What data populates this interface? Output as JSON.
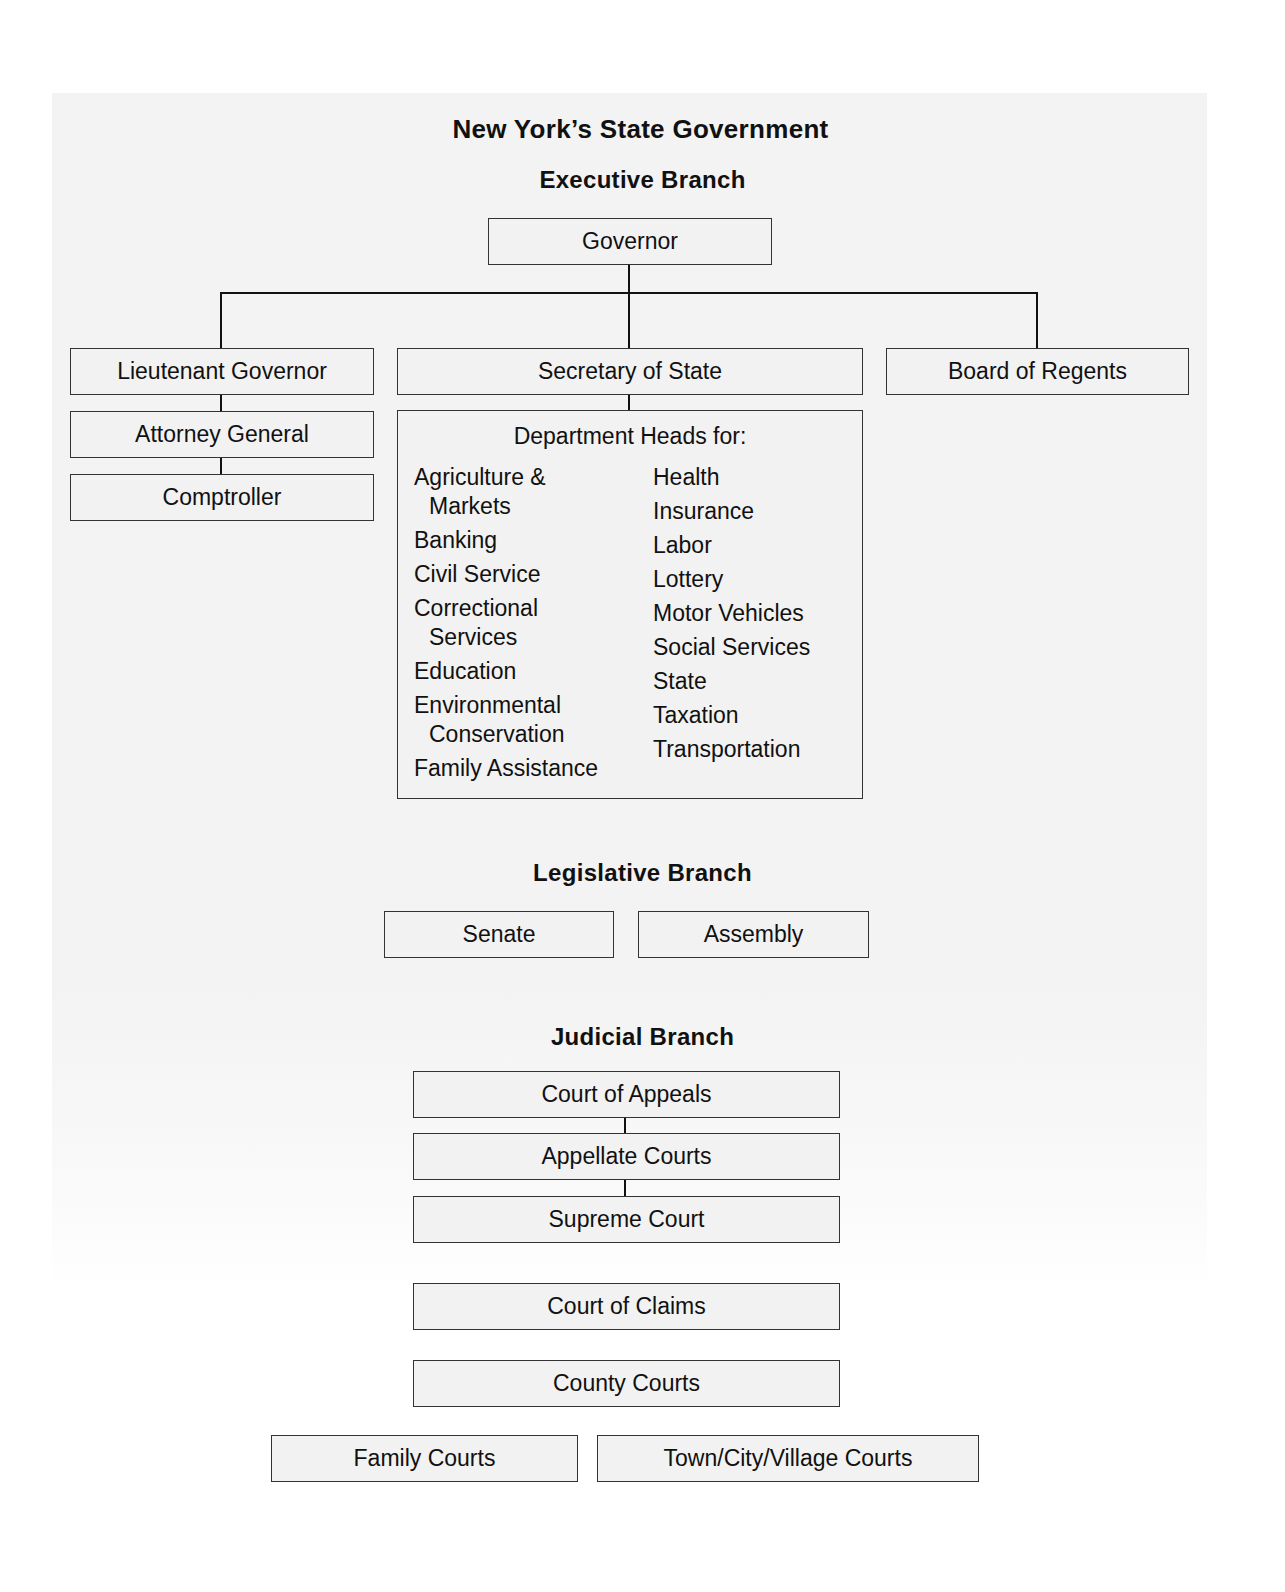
{
  "title": "New York’s State Government",
  "executive": {
    "heading": "Executive Branch",
    "governor": "Governor",
    "lieutenant_governor": "Lieutenant Governor",
    "attorney_general": "Attorney General",
    "comptroller": "Comptroller",
    "secretary_of_state": "Secretary of State",
    "board_of_regents": "Board of Regents",
    "departments": {
      "heading": "Department Heads for:",
      "left": [
        {
          "line1": "Agriculture &",
          "line2": "Markets"
        },
        {
          "line1": "Banking"
        },
        {
          "line1": "Civil Service"
        },
        {
          "line1": "Correctional",
          "line2": "Services"
        },
        {
          "line1": "Education"
        },
        {
          "line1": "Environmental",
          "line2": "Conservation"
        },
        {
          "line1": "Family Assistance"
        }
      ],
      "right": [
        "Health",
        "Insurance",
        "Labor",
        "Lottery",
        "Motor Vehicles",
        "Social Services",
        "State",
        "Taxation",
        "Transportation"
      ]
    }
  },
  "legislative": {
    "heading": "Legislative Branch",
    "senate": "Senate",
    "assembly": "Assembly"
  },
  "judicial": {
    "heading": "Judicial Branch",
    "court_of_appeals": "Court of Appeals",
    "appellate_courts": "Appellate Courts",
    "supreme_court": "Supreme Court",
    "court_of_claims": "Court of Claims",
    "county_courts": "County Courts",
    "family_courts": "Family Courts",
    "local_courts": "Town/City/Village Courts"
  },
  "colors": {
    "panel_bg": "#f3f3f3",
    "box_bg": "#f2f2f2",
    "border": "#333333",
    "text": "#111111"
  }
}
